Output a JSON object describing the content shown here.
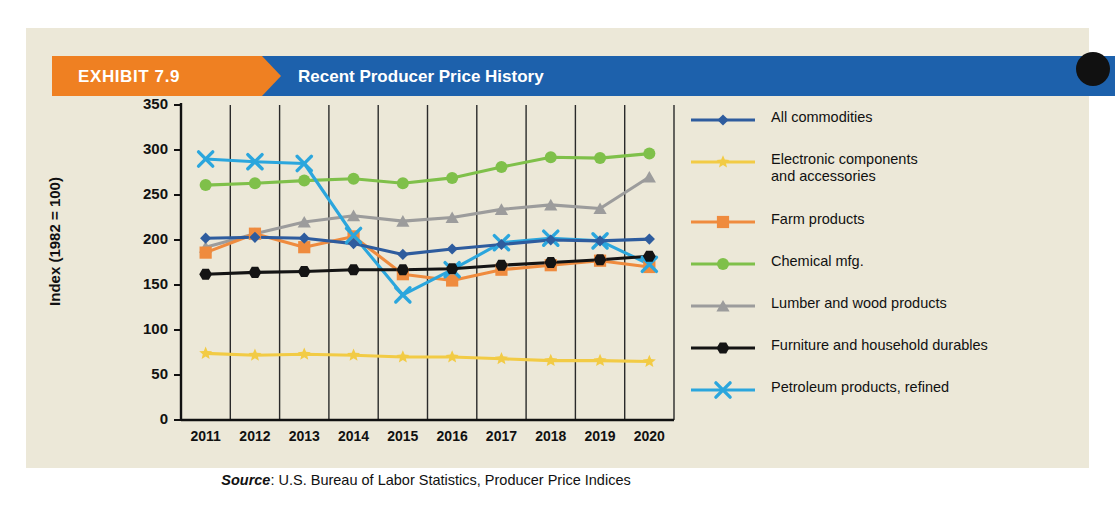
{
  "exhibit": {
    "tag": "EXHIBIT 7.9",
    "title": "Recent Producer Price History",
    "tag_color": "#ef8022",
    "banner_color": "#1d61ac",
    "panel_color": "#ece8d8"
  },
  "chart_data": {
    "type": "line",
    "title": "Recent Producer Price History",
    "xlabel": "",
    "ylabel": "Index (1982 = 100)",
    "categories": [
      "2011",
      "2012",
      "2013",
      "2014",
      "2015",
      "2016",
      "2017",
      "2018",
      "2019",
      "2020"
    ],
    "ylim": [
      0,
      350
    ],
    "yticks": [
      0,
      50,
      100,
      150,
      200,
      250,
      300,
      350
    ],
    "grid": "vertical",
    "legend_position": "right",
    "source": "U.S. Bureau of Labor Statistics, Producer Price Indices",
    "source_prefix": "Source",
    "series": [
      {
        "name": "All commodities",
        "color": "#2e5c9e",
        "marker": "diamond",
        "values": [
          202,
          203,
          202,
          196,
          184,
          190,
          195,
          200,
          199,
          201
        ]
      },
      {
        "name": "Electronic components and accessories",
        "color": "#f2cb45",
        "marker": "star",
        "values": [
          74,
          72,
          73,
          72,
          70,
          70,
          68,
          66,
          66,
          65
        ]
      },
      {
        "name": "Farm products",
        "color": "#ef8b3e",
        "marker": "square",
        "values": [
          186,
          207,
          192,
          204,
          162,
          155,
          167,
          172,
          177,
          170
        ]
      },
      {
        "name": "Chemical mfg.",
        "color": "#7fc04a",
        "marker": "circle",
        "values": [
          261,
          263,
          266,
          268,
          263,
          269,
          281,
          292,
          291,
          296
        ]
      },
      {
        "name": "Lumber and wood products",
        "color": "#9c9c9c",
        "marker": "triangle",
        "values": [
          192,
          207,
          220,
          227,
          221,
          225,
          234,
          239,
          235,
          270
        ]
      },
      {
        "name": "Furniture and household durables",
        "color": "#141414",
        "marker": "hexagon",
        "values": [
          162,
          164,
          165,
          167,
          167,
          168,
          172,
          175,
          178,
          182
        ]
      },
      {
        "name": "Petroleum products, refined",
        "color": "#2ba6dd",
        "marker": "x",
        "values": [
          290,
          287,
          285,
          205,
          139,
          167,
          197,
          202,
          199,
          173
        ]
      }
    ]
  },
  "legend": {
    "items": [
      {
        "label": "All commodities",
        "label2": "",
        "color": "#2e5c9e",
        "marker": "diamond"
      },
      {
        "label": "Electronic components",
        "label2": "and accessories",
        "color": "#f2cb45",
        "marker": "star"
      },
      {
        "label": "Farm products",
        "label2": "",
        "color": "#ef8b3e",
        "marker": "square"
      },
      {
        "label": "Chemical mfg.",
        "label2": "",
        "color": "#7fc04a",
        "marker": "circle"
      },
      {
        "label": "Lumber and wood products",
        "label2": "",
        "color": "#9c9c9c",
        "marker": "triangle"
      },
      {
        "label": "Furniture and household durables",
        "label2": "",
        "color": "#141414",
        "marker": "hexagon"
      },
      {
        "label": "Petroleum products, refined",
        "label2": "",
        "color": "#2ba6dd",
        "marker": "x"
      }
    ]
  }
}
